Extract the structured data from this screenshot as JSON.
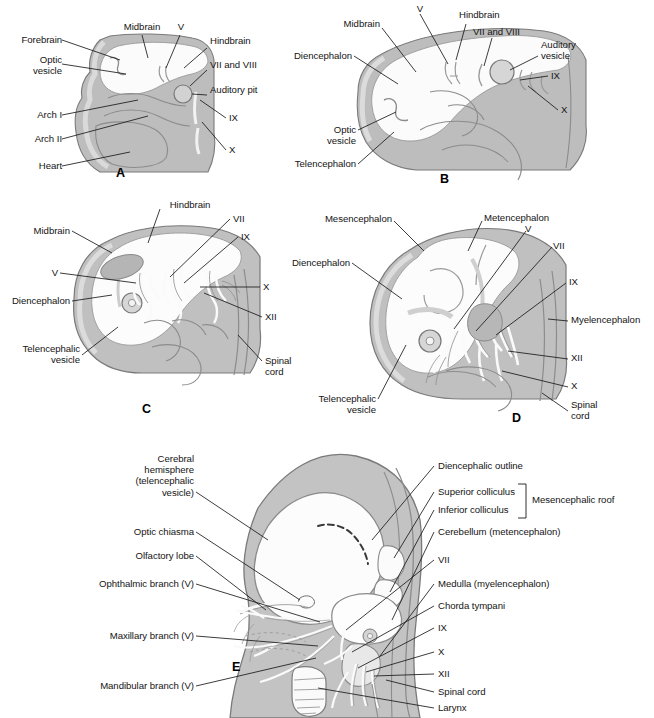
{
  "figure": {
    "background_color": "#ffffff",
    "body_fill": "#b9b9b9",
    "outline_color": "#6e6e6e",
    "neural_fill": "#fdfdfd",
    "line_color": "#1a1a1a"
  },
  "panels": [
    {
      "id": "A",
      "letter": "A",
      "labels_left": [
        {
          "text": "Forebrain"
        },
        {
          "text": "Optic\nvesicle"
        },
        {
          "text": "Arch I"
        },
        {
          "text": "Arch II"
        },
        {
          "text": "Heart"
        }
      ],
      "labels_top": [
        {
          "text": "Midbrain"
        },
        {
          "text": "V"
        }
      ],
      "labels_right": [
        {
          "text": "Hindbrain"
        },
        {
          "text": "VII and VIII"
        },
        {
          "text": "Auditory pit"
        },
        {
          "text": "IX"
        },
        {
          "text": "X"
        }
      ]
    },
    {
      "id": "B",
      "letter": "B",
      "labels_left": [
        {
          "text": "Midbrain"
        },
        {
          "text": "Diencephalon"
        },
        {
          "text": "Optic\nvesicle"
        },
        {
          "text": "Telencephalon"
        }
      ],
      "labels_top": [
        {
          "text": "V"
        },
        {
          "text": "Hindbrain"
        },
        {
          "text": "VII and VIII"
        }
      ],
      "labels_right": [
        {
          "text": "Auditory\nvesicle"
        },
        {
          "text": "IX"
        },
        {
          "text": "X"
        }
      ]
    },
    {
      "id": "C",
      "letter": "C",
      "labels_left": [
        {
          "text": "Midbrain"
        },
        {
          "text": "V"
        },
        {
          "text": "Diencephalon"
        },
        {
          "text": "Telencephalic\nvesicle"
        }
      ],
      "labels_top": [
        {
          "text": "Hindbrain"
        }
      ],
      "labels_right": [
        {
          "text": "VII"
        },
        {
          "text": "IX"
        },
        {
          "text": "X"
        },
        {
          "text": "XII"
        },
        {
          "text": "Spinal\ncord"
        }
      ]
    },
    {
      "id": "D",
      "letter": "D",
      "labels_left": [
        {
          "text": "Mesencephalon"
        },
        {
          "text": "Diencephalon"
        },
        {
          "text": "Telencephalic\nvesicle"
        }
      ],
      "labels_top": [
        {
          "text": "Metencephalon"
        },
        {
          "text": "V"
        },
        {
          "text": "VII"
        }
      ],
      "labels_right": [
        {
          "text": "IX"
        },
        {
          "text": "Myelencephalon"
        },
        {
          "text": "XII"
        },
        {
          "text": "X"
        },
        {
          "text": "Spinal\ncord"
        }
      ]
    },
    {
      "id": "E",
      "letter": "E",
      "labels_left": [
        {
          "text": "Cerebral\nhemisphere\n(telencephalic\nvesicle)"
        },
        {
          "text": "Optic chiasma"
        },
        {
          "text": "Olfactory lobe"
        },
        {
          "text": "Ophthalmic branch (V)"
        },
        {
          "text": "Maxillary branch (V)"
        },
        {
          "text": "Mandibular branch (V)"
        }
      ],
      "labels_right": [
        {
          "text": "Diencephalic outline"
        },
        {
          "text": "Superior colliculus"
        },
        {
          "text": "Inferior colliculus"
        },
        {
          "text": "Cerebellum (metencephalon)"
        },
        {
          "text": "VII"
        },
        {
          "text": "Medulla (myelencephalon)"
        },
        {
          "text": "Chorda tympani"
        },
        {
          "text": "IX"
        },
        {
          "text": "X"
        },
        {
          "text": "XII"
        },
        {
          "text": "Spinal cord"
        },
        {
          "text": "Larynx"
        }
      ],
      "bracket_label": "Mesencephalic roof"
    }
  ]
}
